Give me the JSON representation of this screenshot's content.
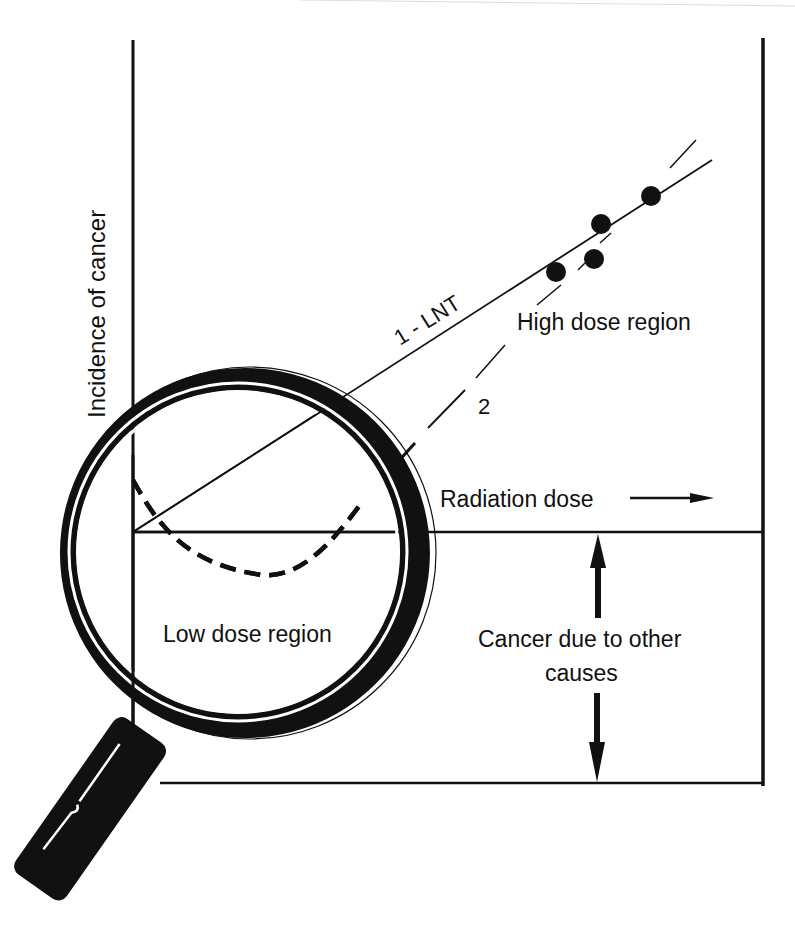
{
  "axes": {
    "y_label": "Incidence of cancer",
    "x_label": "Radiation dose"
  },
  "curves": {
    "lnt_label": "1 - LNT",
    "alt_label": "2"
  },
  "regions": {
    "high": "High dose region",
    "low": "Low dose region"
  },
  "baseline_note": {
    "line1": "Cancer due to other",
    "line2": "causes"
  },
  "data_points": [
    {
      "x": 556,
      "y": 272
    },
    {
      "x": 601,
      "y": 224
    },
    {
      "x": 594,
      "y": 259
    },
    {
      "x": 651,
      "y": 196
    }
  ],
  "colors": {
    "ink": "#111111",
    "background": "#ffffff"
  }
}
